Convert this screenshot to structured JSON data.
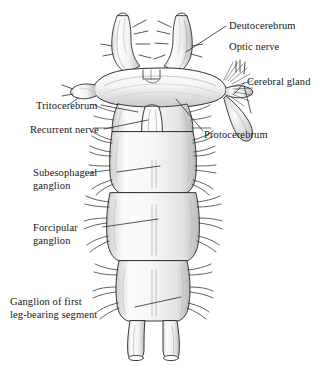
{
  "figure": {
    "background_color": "#ffffff",
    "ink_color": "#161616",
    "shading_color": "#9a9a9a",
    "style": "pen-and-ink stipple line drawing"
  },
  "labels": [
    {
      "id": "deutocerebrum",
      "text": "Deutocerebrum",
      "side": "right",
      "lines": [
        "Deutocerebrum"
      ]
    },
    {
      "id": "optic-nerve",
      "text": "Optic nerve",
      "side": "right",
      "lines": [
        "Optic nerve"
      ]
    },
    {
      "id": "cerebral-gland",
      "text": "Cerebral gland",
      "side": "right",
      "lines": [
        "Cerebral gland"
      ]
    },
    {
      "id": "protocerebrum",
      "text": "Protocerebrum",
      "side": "right",
      "lines": [
        "Protocerebrum"
      ]
    },
    {
      "id": "tritocerebrum",
      "text": "Tritocerebrum",
      "side": "left",
      "lines": [
        "Tritocerebrum"
      ]
    },
    {
      "id": "recurrent-nerve",
      "text": "Recurrent nerve",
      "side": "left",
      "lines": [
        "Recurrent nerve"
      ]
    },
    {
      "id": "subesophageal-ganglion",
      "text": "Subesophageal ganglion",
      "side": "left",
      "lines": [
        "Subesophageal",
        "ganglion"
      ]
    },
    {
      "id": "forcipular-ganglion",
      "text": "Forcipular ganglion",
      "side": "left",
      "lines": [
        "Forcipular",
        "ganglion"
      ]
    },
    {
      "id": "ganglion-first-leg-bearing-segment",
      "text": "Ganglion of first leg-bearing segment",
      "side": "left",
      "lines": [
        "Ganglion of first",
        "leg-bearing segment"
      ]
    }
  ],
  "label_text": {
    "deutocerebrum": "Deutocerebrum",
    "optic_nerve": "Optic nerve",
    "cerebral_gland": "Cerebral gland",
    "protocerebrum": "Protocerebrum",
    "tritocerebrum": "Tritocerebrum",
    "recurrent_nerve": "Recurrent nerve",
    "subesophageal_line1": "Subesophageal",
    "subesophageal_line2": "ganglion",
    "forcipular_line1": "Forcipular",
    "forcipular_line2": "ganglion",
    "first_leg_line1": "Ganglion of first",
    "first_leg_line2": "leg-bearing segment"
  },
  "anatomy": {
    "parts": [
      "left antennal nerve",
      "right antennal nerve",
      "protocerebrum",
      "deutocerebrum",
      "tritocerebrum",
      "optic nerve",
      "cerebral gland",
      "recurrent nerve",
      "subesophageal ganglion",
      "forcipular ganglion",
      "ganglion of first leg-bearing segment",
      "paired ventral connectives"
    ]
  }
}
